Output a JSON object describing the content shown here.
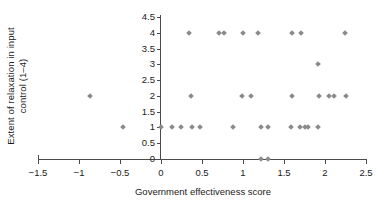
{
  "chart_data": {
    "type": "scatter",
    "title": "",
    "xlabel": "Government effectiveness score",
    "ylabel_line1": "Extent of relaxation in input",
    "ylabel_line2": "control (1–4)",
    "xlim": [
      -1.5,
      2.5
    ],
    "ylim": [
      0,
      4.5
    ],
    "xticks": [
      "−1.5",
      "−1",
      "−0.5",
      "0",
      "0.5",
      "1",
      "1.5",
      "2",
      "2.5"
    ],
    "xtick_values": [
      -1.5,
      -1,
      -0.5,
      0,
      0.5,
      1,
      1.5,
      2,
      2.5
    ],
    "yticks": [
      "0",
      "0.5",
      "1",
      "1.5",
      "2",
      "2.5",
      "3",
      "3.5",
      "4",
      "4.5"
    ],
    "ytick_values": [
      0,
      0.5,
      1,
      1.5,
      2,
      2.5,
      3,
      3.5,
      4,
      4.5
    ],
    "grid": false,
    "legend": null,
    "marker_color": "#8a8a8a",
    "marker_shape": "diamond",
    "axis_color": "#4a4a4a",
    "points": [
      {
        "x": 0.34,
        "y": 4
      },
      {
        "x": 0.71,
        "y": 4
      },
      {
        "x": 0.77,
        "y": 4
      },
      {
        "x": 1.0,
        "y": 4
      },
      {
        "x": 1.18,
        "y": 4
      },
      {
        "x": 1.6,
        "y": 4
      },
      {
        "x": 1.71,
        "y": 4
      },
      {
        "x": 2.24,
        "y": 4
      },
      {
        "x": 1.92,
        "y": 3
      },
      {
        "x": -0.86,
        "y": 2
      },
      {
        "x": 0.36,
        "y": 2
      },
      {
        "x": 0.99,
        "y": 2
      },
      {
        "x": 1.1,
        "y": 2
      },
      {
        "x": 1.6,
        "y": 2
      },
      {
        "x": 1.93,
        "y": 2
      },
      {
        "x": 2.05,
        "y": 2
      },
      {
        "x": 2.11,
        "y": 2
      },
      {
        "x": 2.25,
        "y": 2
      },
      {
        "x": -0.46,
        "y": 1
      },
      {
        "x": 0.0,
        "y": 1
      },
      {
        "x": 0.13,
        "y": 1
      },
      {
        "x": 0.24,
        "y": 1
      },
      {
        "x": 0.38,
        "y": 1
      },
      {
        "x": 0.47,
        "y": 1
      },
      {
        "x": 0.88,
        "y": 1
      },
      {
        "x": 1.22,
        "y": 1
      },
      {
        "x": 1.3,
        "y": 1
      },
      {
        "x": 1.59,
        "y": 1
      },
      {
        "x": 1.7,
        "y": 1
      },
      {
        "x": 1.75,
        "y": 1
      },
      {
        "x": 1.79,
        "y": 1
      },
      {
        "x": 1.92,
        "y": 1
      },
      {
        "x": 1.22,
        "y": 0
      },
      {
        "x": 1.3,
        "y": 0
      }
    ],
    "point_count": 34
  }
}
